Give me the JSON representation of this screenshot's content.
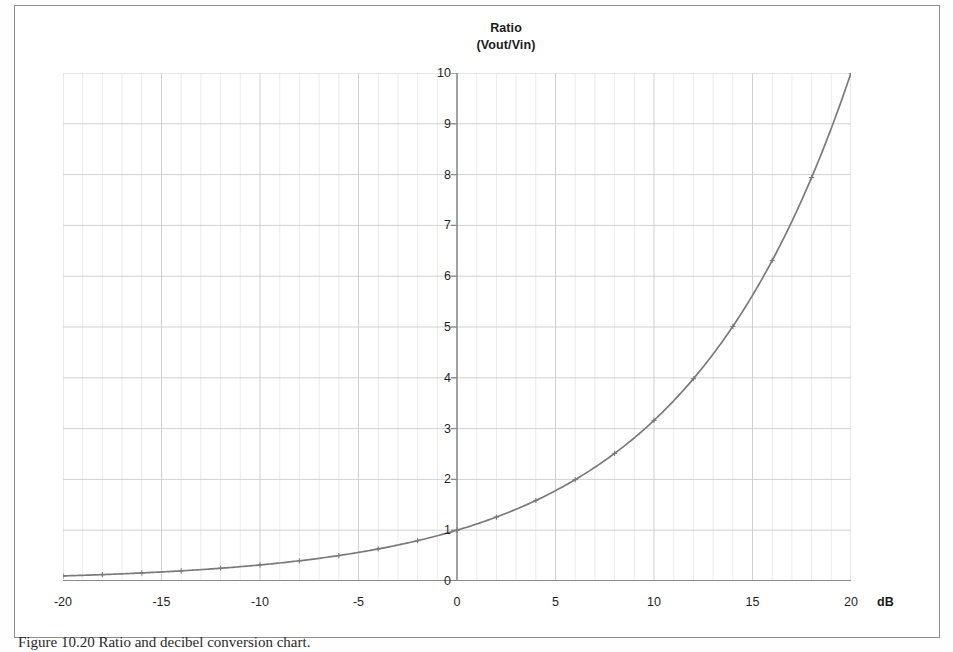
{
  "figure": {
    "caption": "Figure 10.20  Ratio and decibel conversion chart."
  },
  "chart_data": {
    "type": "line",
    "title": "Ratio",
    "subtitle": "(Vout/Vin)",
    "xlabel": "dB",
    "ylabel": "Ratio (Vout/Vin)",
    "xlim": [
      -20,
      20
    ],
    "ylim": [
      0,
      10
    ],
    "xticks": [
      -20,
      -15,
      -10,
      -5,
      0,
      5,
      10,
      15,
      20
    ],
    "xtick_labels": [
      "-20",
      "-15",
      "-10",
      "-5",
      "0",
      "5",
      "10",
      "15",
      "20"
    ],
    "yticks": [
      0,
      1,
      2,
      3,
      4,
      5,
      6,
      7,
      8,
      9,
      10
    ],
    "ytick_labels": [
      "0",
      "1",
      "2",
      "3",
      "4",
      "5",
      "6",
      "7",
      "8",
      "9",
      "10"
    ],
    "grid": true,
    "grid_minor_x_step": 1,
    "grid_major_x_step": 5,
    "grid_y_step": 1,
    "legend": "none",
    "line_color": "#7a7a7a",
    "grid_color": "#cfcfcf",
    "axis_color": "#8a8a8a",
    "formula": "ratio = 10^(dB/20)",
    "series": [
      {
        "name": "Vout/Vin",
        "x": [
          -20,
          -18,
          -16,
          -14,
          -12,
          -10,
          -8,
          -6,
          -4,
          -2,
          0,
          2,
          4,
          6,
          8,
          10,
          12,
          14,
          16,
          18,
          20
        ],
        "values": [
          0.1,
          0.126,
          0.158,
          0.2,
          0.251,
          0.316,
          0.398,
          0.501,
          0.631,
          0.794,
          1.0,
          1.259,
          1.585,
          1.995,
          2.512,
          3.162,
          3.981,
          5.012,
          6.31,
          7.943,
          10.0
        ]
      }
    ]
  }
}
